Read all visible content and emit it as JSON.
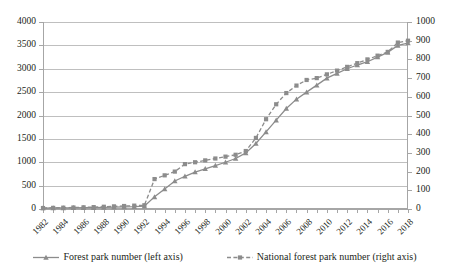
{
  "chart_data": {
    "type": "line",
    "title": "",
    "xlabel": "",
    "ylabel": "",
    "grid": true,
    "legend_position": "bottom",
    "x": [
      1982,
      1983,
      1984,
      1985,
      1986,
      1987,
      1988,
      1989,
      1990,
      1991,
      1992,
      1993,
      1994,
      1995,
      1996,
      1997,
      1998,
      1999,
      2000,
      2001,
      2002,
      2003,
      2004,
      2005,
      2006,
      2007,
      2008,
      2009,
      2010,
      2011,
      2012,
      2013,
      2014,
      2015,
      2016,
      2017,
      2018
    ],
    "x_tick_labels": [
      "1982",
      "1984",
      "1986",
      "1988",
      "1990",
      "1992",
      "1994",
      "1996",
      "1998",
      "2000",
      "2002",
      "2004",
      "2006",
      "2008",
      "2010",
      "2012",
      "2014",
      "2016",
      "2018"
    ],
    "left_axis": {
      "label": "Forest park number (left axis)",
      "min": 0,
      "max": 4000,
      "step": 500,
      "ticks": [
        "0",
        "500",
        "1000",
        "1500",
        "2000",
        "2500",
        "3000",
        "3500",
        "4000"
      ]
    },
    "right_axis": {
      "label": "National forest park number (right axis)",
      "min": 0,
      "max": 1000,
      "step": 100,
      "ticks": [
        "0",
        "100",
        "200",
        "300",
        "400",
        "500",
        "600",
        "700",
        "800",
        "900",
        "1000"
      ]
    },
    "series": [
      {
        "name": "Forest park number (left axis)",
        "axis": "left",
        "marker": "triangle",
        "line_style": "solid",
        "color": "#8c8c8c",
        "values": [
          20,
          22,
          24,
          26,
          28,
          30,
          35,
          40,
          45,
          50,
          60,
          260,
          430,
          600,
          700,
          790,
          860,
          930,
          1000,
          1080,
          1200,
          1400,
          1650,
          1900,
          2150,
          2350,
          2500,
          2650,
          2800,
          2900,
          3000,
          3080,
          3150,
          3250,
          3350,
          3500,
          3550
        ]
      },
      {
        "name": "National forest park number (right axis)",
        "axis": "right",
        "marker": "square",
        "line_style": "dashed",
        "color": "#8c8c8c",
        "values": [
          5,
          6,
          7,
          8,
          9,
          10,
          12,
          14,
          16,
          18,
          20,
          160,
          180,
          200,
          240,
          250,
          260,
          270,
          280,
          290,
          310,
          380,
          480,
          560,
          620,
          660,
          690,
          700,
          720,
          740,
          760,
          780,
          800,
          820,
          840,
          890,
          900
        ]
      }
    ]
  },
  "legend": {
    "items": [
      {
        "label": "Forest park number (left axis)",
        "marker": "triangle-marker-icon",
        "style": "solid"
      },
      {
        "label": "National forest park number (right axis)",
        "marker": "square-marker-icon",
        "style": "dashed"
      }
    ]
  },
  "colors": {
    "series": "#8c8c8c",
    "grid": "#bfbfbf",
    "axis": "#a6a6a6",
    "text": "#231f20"
  }
}
